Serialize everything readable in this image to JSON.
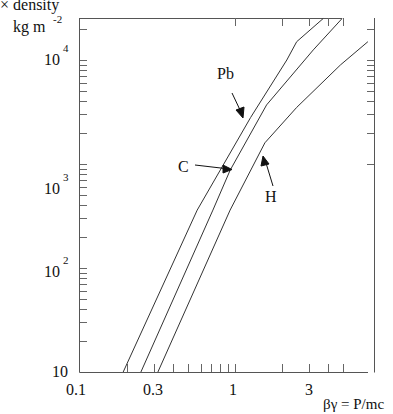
{
  "chart_data": {
    "type": "line",
    "title": "",
    "ylabel_lines": [
      "× density",
      "kg m"
    ],
    "ylabel_sup": "-2",
    "xlabel": "βγ = P/mc",
    "xscale": "log",
    "yscale": "log",
    "xlim": [
      0.1,
      7.9
    ],
    "ylim": [
      10,
      25000
    ],
    "grid": false,
    "x_ticks": [
      {
        "value": 0.1,
        "label": "0.1"
      },
      {
        "value": 0.3,
        "label": "0.3"
      },
      {
        "value": 1,
        "label": "1"
      },
      {
        "value": 3,
        "label": "3"
      }
    ],
    "y_ticks": [
      {
        "value": 10,
        "base": "10",
        "exp": ""
      },
      {
        "value": 100,
        "base": "10",
        "exp": "2"
      },
      {
        "value": 1000,
        "base": "10",
        "exp": "3"
      },
      {
        "value": 10000,
        "base": "10",
        "exp": "4"
      }
    ],
    "series": [
      {
        "name": "Pb",
        "x": [
          0.19,
          0.57,
          1.26,
          2.16,
          2.5,
          3.7
        ],
        "y": [
          10,
          360,
          2800,
          10000,
          15000,
          25000
        ]
      },
      {
        "name": "C",
        "x": [
          0.247,
          0.72,
          0.93,
          1.6,
          3.2,
          4.9
        ],
        "y": [
          10,
          360,
          870,
          3700,
          12500,
          25000
        ]
      },
      {
        "name": "H",
        "x": [
          0.318,
          0.93,
          1.56,
          2.5,
          4.8,
          7.2
        ],
        "y": [
          10,
          360,
          1600,
          3500,
          9000,
          15000
        ]
      }
    ],
    "annotations": [
      {
        "text": "Pb",
        "target_series": "Pb"
      },
      {
        "text": "C",
        "target_series": "C"
      },
      {
        "text": "H",
        "target_series": "H"
      }
    ],
    "legend": "none (inline arrow labels)"
  },
  "labels": {
    "ylabel_line1": "× density",
    "ylabel_line2": "kg m",
    "ylabel_sup": "-2",
    "xlabel": "βγ = P/mc",
    "xt_0": "0.1",
    "xt_1": "0.3",
    "xt_2": "1",
    "xt_3": "3",
    "yt_10": "10",
    "yt_100": "10",
    "yt_100_exp": "2",
    "yt_1000": "10",
    "yt_1000_exp": "3",
    "yt_10000": "10",
    "yt_10000_exp": "4",
    "ann_pb": "Pb",
    "ann_c": "C",
    "ann_h": "H"
  }
}
